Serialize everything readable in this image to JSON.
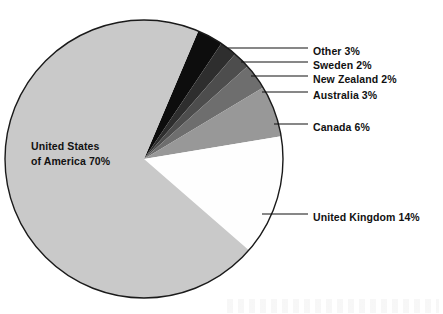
{
  "chart_data": {
    "type": "pie",
    "title": "",
    "subtitle": "",
    "xlabel": "",
    "ylabel": "",
    "legend_position": "callout-labels-right",
    "grid": false,
    "value_unit": "percent",
    "total": 100,
    "categories": [
      "United States of America",
      "United Kingdom",
      "Canada",
      "Australia",
      "New Zealand",
      "Sweden",
      "Other"
    ],
    "values": [
      70,
      14,
      6,
      3,
      2,
      2,
      3
    ],
    "slices": [
      {
        "name": "other-slice",
        "label": "Other 3%",
        "category": "Other",
        "value": 3,
        "color": "#0d0d0d",
        "start_angle": -67,
        "end_angle": -56.2,
        "label_x": 313,
        "label_y": 52,
        "leader_x1": 228,
        "leader_y1": 48,
        "leader_x2": 308,
        "leader_y2": 48
      },
      {
        "name": "sweden-slice",
        "label": "Sweden 2%",
        "category": "Sweden",
        "value": 2,
        "color": "#2e2e2e",
        "start_angle": -56.2,
        "end_angle": -49,
        "label_x": 313,
        "label_y": 66,
        "leader_x1": 241,
        "leader_y1": 62,
        "leader_x2": 308,
        "leader_y2": 62
      },
      {
        "name": "new-zealand-slice",
        "label": "New Zealand 2%",
        "category": "New Zealand",
        "value": 2,
        "color": "#4d4d4d",
        "start_angle": -49,
        "end_angle": -41.8,
        "label_x": 313,
        "label_y": 80,
        "leader_x1": 251,
        "leader_y1": 76,
        "leader_x2": 308,
        "leader_y2": 76
      },
      {
        "name": "australia-slice",
        "label": "Australia 3%",
        "category": "Australia",
        "value": 3,
        "color": "#6e6e6e",
        "start_angle": -41.8,
        "end_angle": -31,
        "label_x": 313,
        "label_y": 96,
        "leader_x1": 262,
        "leader_y1": 92,
        "leader_x2": 308,
        "leader_y2": 92
      },
      {
        "name": "canada-slice",
        "label": "Canada 6%",
        "category": "Canada",
        "value": 6,
        "color": "#989898",
        "start_angle": -31,
        "end_angle": -9.4,
        "label_x": 313,
        "label_y": 128,
        "leader_x1": 274,
        "leader_y1": 124,
        "leader_x2": 308,
        "leader_y2": 124
      },
      {
        "name": "united-kingdom-slice",
        "label": "United Kingdom 14%",
        "category": "United Kingdom",
        "value": 14,
        "color": "#fefefe",
        "start_angle": -9.4,
        "end_angle": 41,
        "label_x": 313,
        "label_y": 218,
        "leader_x1": 262,
        "leader_y1": 214,
        "leader_x2": 308,
        "leader_y2": 214
      },
      {
        "name": "united-states-slice",
        "label": "United States of America 70%",
        "category": "United States of America",
        "value": 70,
        "color": "#c9c9c9",
        "start_angle": 41,
        "end_angle": 293,
        "label_x": 0,
        "label_y": 0,
        "leader_x1": 0,
        "leader_y1": 0,
        "leader_x2": 0,
        "leader_y2": 0
      }
    ],
    "inner_label": {
      "line1": "United States",
      "line2": "of America 70%",
      "x": 31,
      "y": 150
    },
    "geometry": {
      "center_x": 144,
      "center_y": 159,
      "radius": 139
    }
  }
}
